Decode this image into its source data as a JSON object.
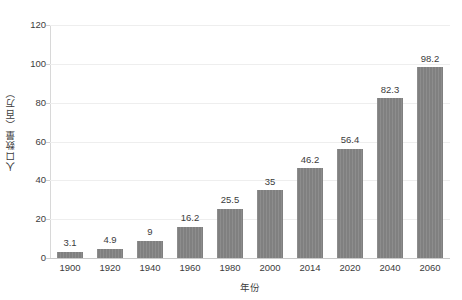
{
  "chart_data": {
    "type": "bar",
    "title": "",
    "subtitle": "",
    "xlabel": "年份",
    "ylabel": "人口数量（百万）",
    "categories": [
      "1900",
      "1920",
      "1940",
      "1960",
      "1980",
      "2000",
      "2014",
      "2020",
      "2040",
      "2060"
    ],
    "values": [
      3.1,
      4.9,
      9,
      16.2,
      25.5,
      35,
      46.2,
      56.4,
      82.3,
      98.2
    ],
    "value_labels": [
      "3.1",
      "4.9",
      "9",
      "16.2",
      "25.5",
      "35",
      "46.2",
      "56.4",
      "82.3",
      "98.2"
    ],
    "ylim": [
      0,
      120
    ],
    "yticks": [
      0,
      20,
      40,
      60,
      80,
      100,
      120
    ],
    "ytick_labels": [
      "0",
      "20",
      "40",
      "60",
      "80",
      "100",
      "120"
    ],
    "grid": true,
    "grid_axis": "y",
    "legend": false,
    "legend_position": "none",
    "bar_color": "#808080",
    "grid_color": "#eeeeee",
    "axis_color": "#cfcfcf",
    "text_color": "#3c3c3c",
    "background_color": "#ffffff",
    "show_value_labels": true
  }
}
